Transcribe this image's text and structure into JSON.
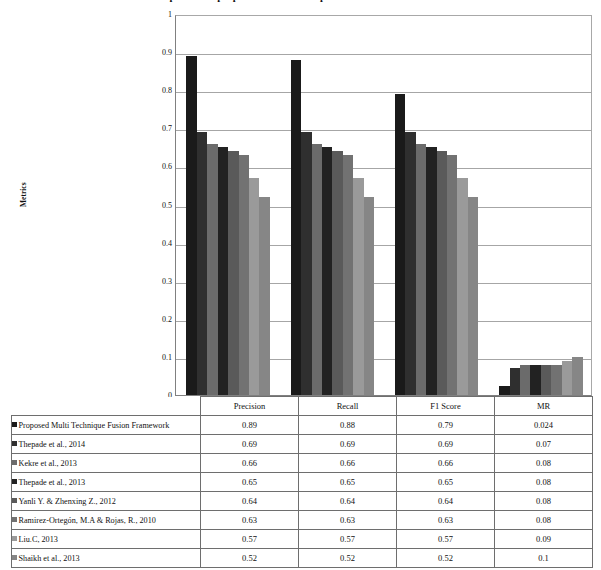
{
  "chart_data": {
    "type": "bar",
    "title": "Comparison of proposed method with previous methods on Datasets",
    "xlabel": "",
    "ylabel": "Metrics",
    "ylim": [
      0,
      1
    ],
    "ytick_labels": [
      "1",
      "0.9",
      "0.8",
      "0.7",
      "0.6",
      "0.5",
      "0.4",
      "0.3",
      "0.2",
      "0.1",
      "0"
    ],
    "ytick_values": [
      1,
      0.9,
      0.8,
      0.7,
      0.6,
      0.5,
      0.4,
      0.3,
      0.2,
      0.1,
      0
    ],
    "grid": true,
    "legend_position": "data-table-left",
    "categories": [
      "Precision",
      "Recall",
      "F1 Score",
      "MR"
    ],
    "series": [
      {
        "name": "Proposed Multi Technique Fusion Framework",
        "color": "#1a1a1a",
        "values": [
          0.89,
          0.88,
          0.79,
          0.024
        ],
        "display_values": [
          "0.89",
          "0.88",
          "0.79",
          "0.024"
        ]
      },
      {
        "name": "Thepade et al., 2014",
        "color": "#2f2f2f",
        "values": [
          0.69,
          0.69,
          0.69,
          0.07
        ],
        "display_values": [
          "0.69",
          "0.69",
          "0.69",
          "0.07"
        ]
      },
      {
        "name": "Kekre et al., 2013",
        "color": "#6b6b6b",
        "values": [
          0.66,
          0.66,
          0.66,
          0.08
        ],
        "display_values": [
          "0.66",
          "0.66",
          "0.66",
          "0.08"
        ]
      },
      {
        "name": "Thepade et al., 2013",
        "color": "#222222",
        "values": [
          0.65,
          0.65,
          0.65,
          0.08
        ],
        "display_values": [
          "0.65",
          "0.65",
          "0.65",
          "0.08"
        ]
      },
      {
        "name": "Yanli Y. & Zhenxing Z., 2012",
        "color": "#5a5a5a",
        "values": [
          0.64,
          0.64,
          0.64,
          0.08
        ],
        "display_values": [
          "0.64",
          "0.64",
          "0.64",
          "0.08"
        ]
      },
      {
        "name": "Ramirez-Ortegón, M.A & Rojas, R., 2010",
        "color": "#727272",
        "values": [
          0.63,
          0.63,
          0.63,
          0.08
        ],
        "display_values": [
          "0.63",
          "0.63",
          "0.63",
          "0.08"
        ]
      },
      {
        "name": "Liu.C, 2013",
        "color": "#9a9a9a",
        "values": [
          0.57,
          0.57,
          0.57,
          0.09
        ],
        "display_values": [
          "0.57",
          "0.57",
          "0.57",
          "0.09"
        ]
      },
      {
        "name": "Shaikh et al., 2013",
        "color": "#868686",
        "values": [
          0.52,
          0.52,
          0.52,
          0.1
        ],
        "display_values": [
          "0.52",
          "0.52",
          "0.52",
          "0.1"
        ]
      }
    ]
  }
}
